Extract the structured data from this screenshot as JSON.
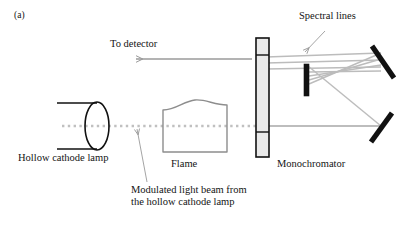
{
  "figure": {
    "panel_label": "(a)",
    "background_color": "#ffffff",
    "width": 408,
    "height": 228
  },
  "labels": {
    "to_detector": "To detector",
    "spectral_lines": "Spectral lines",
    "hollow_cathode_lamp": "Hollow cathode lamp",
    "flame": "Flame",
    "monochromator": "Monochromator",
    "modulated_beam_line1": "Modulated light beam from",
    "modulated_beam_line2": "the hollow cathode lamp"
  },
  "colors": {
    "ink_black": "#111111",
    "beam_gray": "#b9b9b9",
    "ray_gray": "#a8a8a8",
    "outline_gray": "#8d8d8d",
    "slit_fill": "#e8e8e8",
    "leader_gray": "#9a9a9a",
    "text": "#141414"
  },
  "components": [
    {
      "name": "hollow-cathode-lamp",
      "type": "cylinder",
      "body_top_y": 103,
      "body_bottom_y": 149,
      "body_left_x": 57,
      "body_right_x": 96,
      "ellipse_cx": 97,
      "ellipse_cy": 126,
      "ellipse_rx": 12,
      "ellipse_ry": 24
    },
    {
      "name": "flame",
      "type": "wavy-box",
      "left_x": 163,
      "right_x": 227,
      "top_y": 105,
      "bottom_y": 152
    },
    {
      "name": "monochromator-entrance-slit",
      "type": "tall-rect",
      "x": 256,
      "y": 38,
      "width": 13,
      "height": 119
    },
    {
      "name": "exit-slit-bar",
      "type": "thick-bar",
      "x": 304,
      "y": 64,
      "width": 5,
      "height": 32
    },
    {
      "name": "upper-mirror",
      "type": "tilted-bar",
      "x1": 372,
      "y1": 46,
      "x2": 394,
      "y2": 78
    },
    {
      "name": "lower-mirror",
      "type": "tilted-bar",
      "x1": 371,
      "y1": 142,
      "x2": 392,
      "y2": 113
    }
  ],
  "beams": {
    "modulated_dotted": {
      "from_x": 62,
      "to_x": 262,
      "y": 126
    },
    "flame_to_slit": {
      "from_x": 227,
      "to_x": 262,
      "y": 126
    },
    "slit_to_lower_mirror": {
      "from_x": 262,
      "to_x": 380,
      "y": 126
    },
    "spectral_rays_y": [
      57,
      63,
      69
    ],
    "spectral_rays_from_x": 266,
    "spectral_rays_to_x": 381,
    "to_detector_arrow": {
      "from_x": 250,
      "to_x": 133,
      "y": 59
    }
  },
  "leaders": [
    {
      "name": "spectral-lines-leader",
      "x1": 324,
      "y1": 30,
      "x2": 304,
      "y2": 51
    },
    {
      "name": "modulated-beam-leader",
      "x1": 146,
      "y1": 182,
      "x2": 137,
      "y2": 129
    }
  ]
}
